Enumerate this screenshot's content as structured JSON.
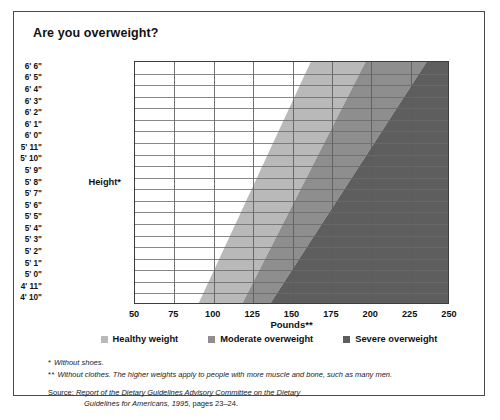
{
  "title": "Are you overweight?",
  "axes": {
    "y_title": "Height*",
    "x_title": "Pounds**",
    "y_labels": [
      "6' 6\"",
      "6' 5\"",
      "6' 4\"",
      "6' 3\"",
      "6' 2\"",
      "6' 1\"",
      "6' 0\"",
      "5' 11\"",
      "5' 10\"",
      "5' 9\"",
      "5' 8\"",
      "5' 7\"",
      "5' 6\"",
      "5' 5\"",
      "5' 4\"",
      "5' 3\"",
      "5' 2\"",
      "5' 1\"",
      "5' 0\"",
      "4' 11\"",
      "4' 10\""
    ],
    "x_labels": [
      "50",
      "75",
      "100",
      "125",
      "150",
      "175",
      "200",
      "225",
      "250"
    ]
  },
  "legend": [
    {
      "label": "Healthy weight",
      "color": "#b9b9b9"
    },
    {
      "label": "Moderate overweight",
      "color": "#8e8e8e"
    },
    {
      "label": "Severe overweight",
      "color": "#5e5e5e"
    }
  ],
  "notes": [
    {
      "mark": "*",
      "text": "Without shoes."
    },
    {
      "mark": "**",
      "text": "Without clothes. The higher weights apply to people with more muscle and bone, such as many men."
    }
  ],
  "source": {
    "lead": "Source:",
    "italic1": "Report of the Dietary Guidelines Advisory Committee on the Dietary",
    "italic2": "Guidelines for Americans, 1995",
    "tail": ", pages 23–24."
  },
  "chart_data": {
    "type": "area",
    "title": "Are you overweight?",
    "xlabel": "Pounds**",
    "ylabel": "Height*",
    "xlim": [
      50,
      250
    ],
    "ylim_labels": [
      "4' 10\"",
      "6' 6\""
    ],
    "x_ticks": [
      50,
      75,
      100,
      125,
      150,
      175,
      200,
      225,
      250
    ],
    "y_ticks": [
      "6' 6\"",
      "6' 5\"",
      "6' 4\"",
      "6' 3\"",
      "6' 2\"",
      "6' 1\"",
      "6' 0\"",
      "5' 11\"",
      "5' 10\"",
      "5' 9\"",
      "5' 8\"",
      "5' 7\"",
      "5' 6\"",
      "5' 5\"",
      "5' 4\"",
      "5' 3\"",
      "5' 2\"",
      "5' 1\"",
      "5' 0\"",
      "4' 11\"",
      "4' 10\""
    ],
    "grid": true,
    "legend_position": "below-axis",
    "bands": [
      {
        "name": "Healthy weight",
        "color": "#b9b9b9",
        "lower_bound_lbs": {
          "at_bottom_height": 91,
          "at_top_height": 162
        },
        "upper_bound_lbs": {
          "at_bottom_height": 119,
          "at_top_height": 197
        }
      },
      {
        "name": "Moderate overweight",
        "color": "#8e8e8e",
        "lower_bound_lbs": {
          "at_bottom_height": 119,
          "at_top_height": 197
        },
        "upper_bound_lbs": {
          "at_bottom_height": 137,
          "at_top_height": 236
        }
      },
      {
        "name": "Severe overweight",
        "color": "#5e5e5e",
        "lower_bound_lbs": {
          "at_bottom_height": 137,
          "at_top_height": 236
        },
        "upper_bound_lbs": {
          "at_bottom_height": 250,
          "at_top_height": 250
        }
      }
    ]
  }
}
